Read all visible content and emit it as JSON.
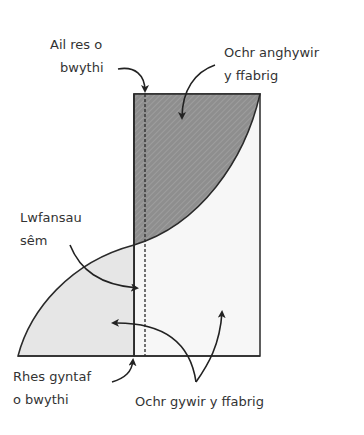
{
  "diagram": {
    "type": "seam-allowance-diagram",
    "labels": {
      "second_row_stitches": [
        "Ail res o",
        "bwythi"
      ],
      "wrong_side_fabric": [
        "Ochr anghywir",
        "y ffabrig"
      ],
      "seam_allowance": [
        "Lwfansau",
        "sêm"
      ],
      "first_row_stitches": [
        "Rhes gyntaf",
        "o bwythi"
      ],
      "right_side_fabric": "Ochr gywir y ffabrig"
    },
    "colors": {
      "wrong_side_fill": "#8a8a8a",
      "right_side_fill": "#e6e6e6",
      "rect_fill": "#f7f7f7",
      "stroke": "#2a2a2a",
      "text": "#333333"
    }
  }
}
